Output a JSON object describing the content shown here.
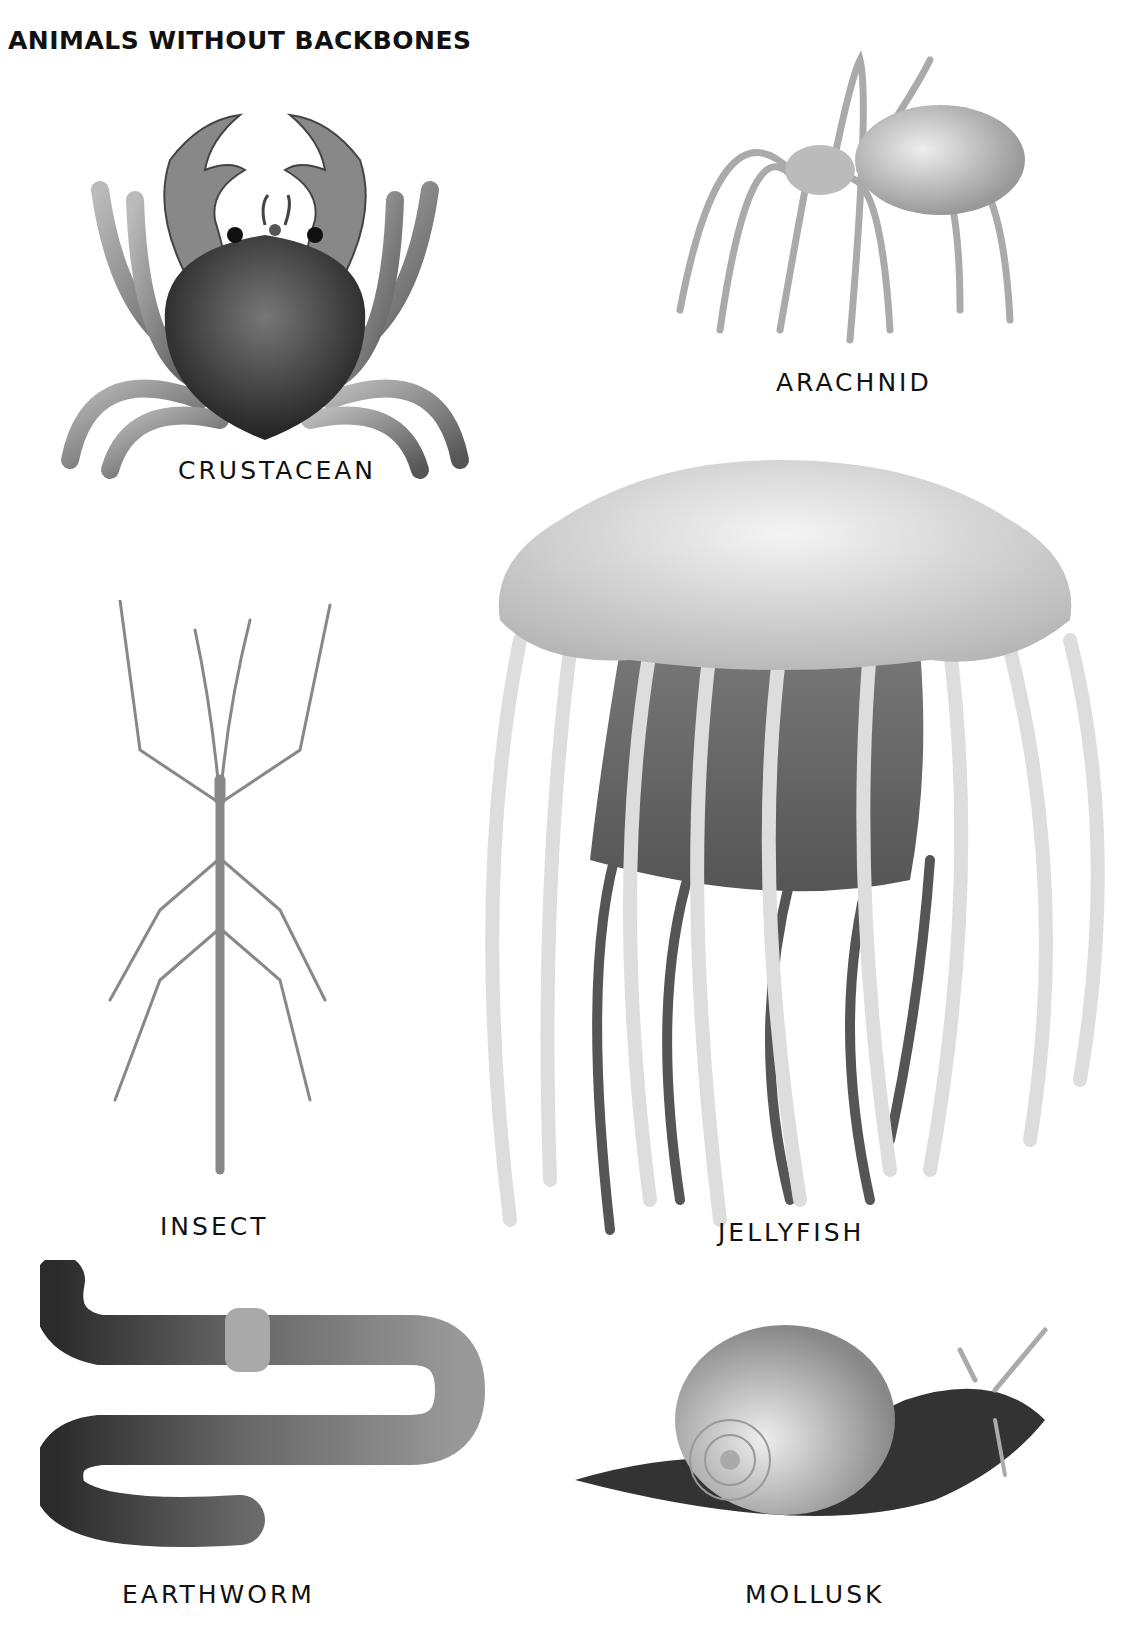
{
  "page": {
    "title": "ANIMALS WITHOUT BACKBONES"
  },
  "animals": [
    {
      "name": "crab",
      "label": "CRUSTACEAN"
    },
    {
      "name": "spider",
      "label": "ARACHNID"
    },
    {
      "name": "jellyfish",
      "label": "JELLYFISH"
    },
    {
      "name": "stick-insect",
      "label": "INSECT"
    },
    {
      "name": "earthworm",
      "label": "EARTHWORM"
    },
    {
      "name": "snail",
      "label": "MOLLUSK"
    }
  ]
}
